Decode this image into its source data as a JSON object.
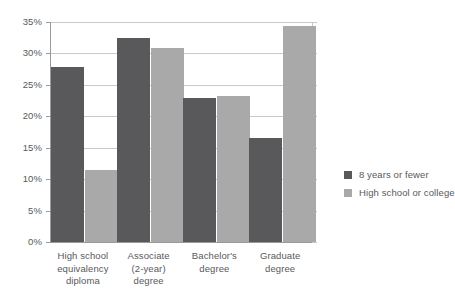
{
  "chart_data": {
    "type": "bar",
    "title": "",
    "subtitle": "",
    "xlabel": "",
    "ylabel": "",
    "ylim": [
      0,
      35
    ],
    "ytick_step": 5,
    "ytick_labels": [
      "0%",
      "5%",
      "10%",
      "15%",
      "20%",
      "25%",
      "30%",
      "35%"
    ],
    "ytick_values": [
      0,
      5,
      10,
      15,
      20,
      25,
      30,
      35
    ],
    "grid": true,
    "legend_position": "right",
    "orientation": "vertical",
    "grouped": true,
    "categories": [
      "High school\nequivalency\ndiploma",
      "Associate\n(2-year)\ndegree",
      "Bachelor's\ndegree",
      "Graduate\ndegree"
    ],
    "series": [
      {
        "name": "8 years or fewer",
        "color": "#59595b",
        "values": [
          27.8,
          32.5,
          22.9,
          16.5
        ]
      },
      {
        "name": "High school or college",
        "color": "#a9a9a9",
        "values": [
          11.4,
          30.8,
          23.2,
          34.4
        ]
      }
    ]
  },
  "colors": {
    "series_dark": "#59595b",
    "series_light": "#a9a9a9",
    "gridline": "#c9c9c9",
    "axis": "#9a9a9a",
    "text": "#58595b",
    "background": "#ffffff"
  }
}
